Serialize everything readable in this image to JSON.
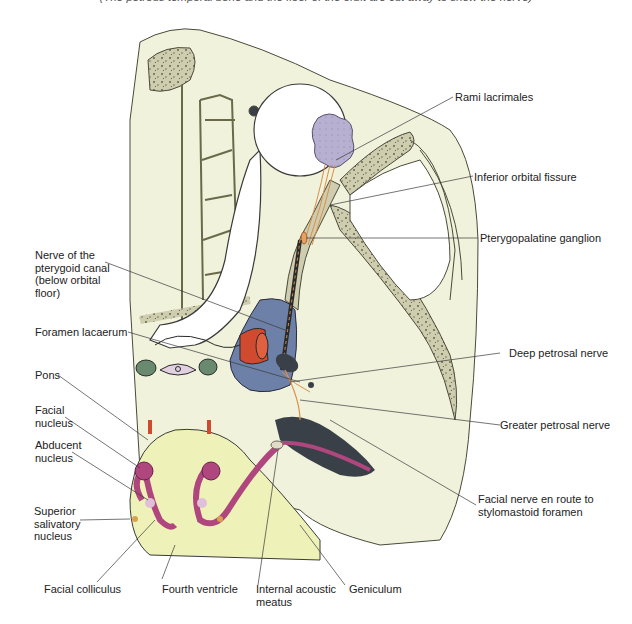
{
  "caption": "(The petrous temporal bone and the floor of the orbit are cut away to show the nerve)",
  "colors": {
    "tissue": "#f0f2dc",
    "bone": "#cfcdb0",
    "bone_speckle": "#5a5a3a",
    "outline": "#4a4a3a",
    "lacrimal_gland": "#b8b0d0",
    "nerve": "#d9904a",
    "carotid": "#d04a30",
    "sinus": "#6c80a8",
    "pons": "#eef2b8",
    "nucleus": "#b0467e",
    "abducent": "#e0c0d8",
    "dark_cavity": "#3a4048"
  },
  "labels": {
    "rami_lacrimales": "Rami lacrimales",
    "inferior_orbital_fissure": "Inferior orbital fissure",
    "pterygopalatine_ganglion": "Pterygopalatine ganglion",
    "nerve_pterygoid_canal": "Nerve of the\npterygoid canal\n(below orbital\nfloor)",
    "foramen_lacaerum": "Foramen lacaerum",
    "deep_petrosal_nerve": "Deep petrosal nerve",
    "greater_petrosal_nerve": "Greater petrosal nerve",
    "facial_nerve_route": "Facial nerve en route to\nstylomastoid foramen",
    "pons": "Pons",
    "facial_nucleus": "Facial\nnucleus",
    "abducent_nucleus": "Abducent\nnucleus",
    "superior_salivatory_nucleus": "Superior\nsalivatory\nnucleus",
    "facial_colliculus": "Facial colliculus",
    "fourth_ventricle": "Fourth ventricle",
    "internal_acoustic_meatus": "Internal acoustic\nmeatus",
    "geniculum": "Geniculum"
  }
}
